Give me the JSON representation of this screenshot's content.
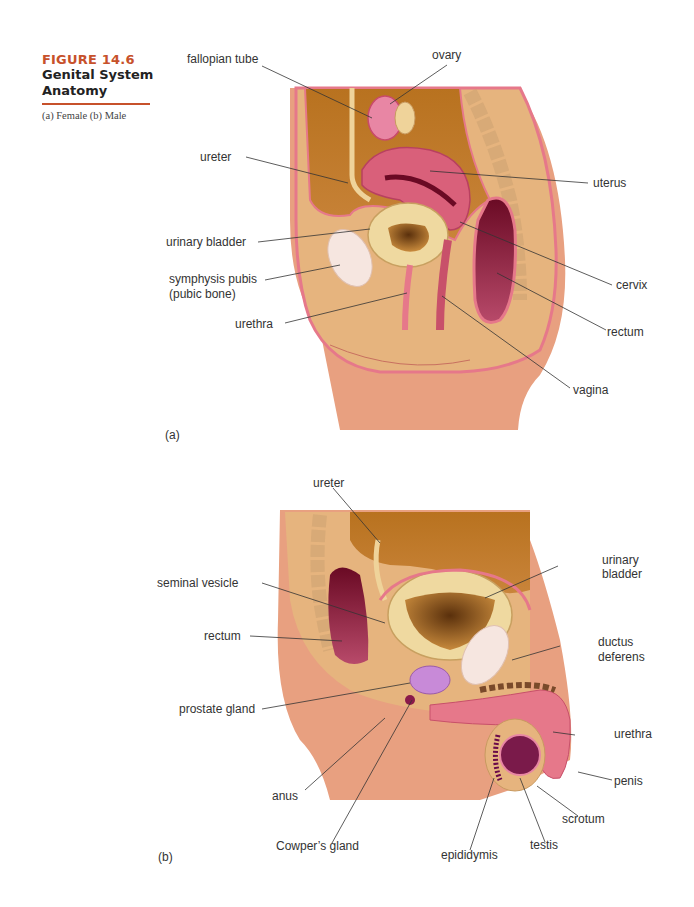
{
  "figure": {
    "number": "FIGURE 14.6",
    "title_line1": "Genital System",
    "title_line2": "Anatomy",
    "subtitle": "(a) Female (b) Male",
    "accent_color": "#c7512b"
  },
  "panel_a": {
    "tag": "(a)",
    "labels": {
      "fallopian_tube": "fallopian tube",
      "ovary": "ovary",
      "ureter": "ureter",
      "uterus": "uterus",
      "urinary_bladder": "urinary bladder",
      "symphysis_pubis_1": "symphysis pubis",
      "symphysis_pubis_2": "(pubic bone)",
      "cervix": "cervix",
      "urethra": "urethra",
      "rectum": "rectum",
      "vagina": "vagina"
    }
  },
  "panel_b": {
    "tag": "(b)",
    "labels": {
      "ureter": "ureter",
      "urinary_bladder_1": "urinary",
      "urinary_bladder_2": "bladder",
      "seminal_vesicle": "seminal vesicle",
      "rectum": "rectum",
      "ductus_deferens_1": "ductus",
      "ductus_deferens_2": "deferens",
      "prostate_gland": "prostate gland",
      "urethra": "urethra",
      "penis": "penis",
      "anus": "anus",
      "scrotum": "scrotum",
      "cowpers_gland": "Cowper’s gland",
      "testis": "testis",
      "epididymis": "epididymis"
    }
  },
  "colors": {
    "skin": "#e8a080",
    "tissue": "#e6b47e",
    "cavity": "#c27a2a",
    "pink_wall": "#e6788a",
    "uterus": "#d9607a",
    "rectum": "#7a1030",
    "bladder": "#efd9a0",
    "bone": "#f6e6e0"
  }
}
